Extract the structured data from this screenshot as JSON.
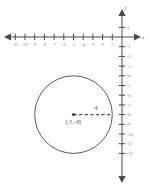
{
  "figure": {
    "kind": "coordinate-plane-circle-graph",
    "background_color": "#ffffff",
    "axis_color": "#4a4a4a",
    "label_color": "#777777",
    "curve_color": "#5a5a5a"
  },
  "axes": {
    "x_axis_name": "x",
    "y_axis_name": "y",
    "origin_px": {
      "x": 122,
      "y": 37
    },
    "unit_px": 9.7,
    "x_tick_values": [
      -11,
      -10,
      -9,
      -8,
      -7,
      -6,
      -5,
      -4,
      -3,
      -2,
      -1
    ],
    "x_tick_labels": [
      "-11",
      "-10",
      "-9",
      "-8",
      "-7",
      "-6",
      "-5",
      "-4",
      "-3",
      "-2",
      "-1"
    ],
    "y_tick_values": [
      1,
      -1,
      -2,
      -3,
      -4,
      -5,
      -6,
      -7,
      -8,
      -9,
      -10,
      -11,
      -12
    ],
    "y_tick_labels": [
      "1",
      "-1",
      "-2",
      "-3",
      "-4",
      "-5",
      "-6",
      "-7",
      "-8",
      "-9",
      "-10",
      "-11",
      "-12"
    ],
    "x_range": [
      -12,
      1
    ],
    "y_range": [
      -13,
      2
    ]
  },
  "chart_data": {
    "type": "scatter",
    "title": "",
    "xlabel": "x",
    "ylabel": "y",
    "xlim": [
      -12,
      1
    ],
    "ylim": [
      -13,
      2
    ],
    "grid": false,
    "legend": false,
    "shapes": [
      {
        "shape": "circle",
        "center": [
          -5,
          -8
        ],
        "center_label": "(-5, -8)",
        "radius": 4,
        "radius_label": "4",
        "radius_line": {
          "from": [
            -5,
            -8
          ],
          "to": [
            -1,
            -8
          ],
          "style": "dashed"
        },
        "stroke": "#5a5a5a",
        "fill": "none"
      }
    ],
    "points": [
      {
        "x": -5,
        "y": -8,
        "label": "(-5, -8)",
        "marker": "dot"
      }
    ]
  }
}
